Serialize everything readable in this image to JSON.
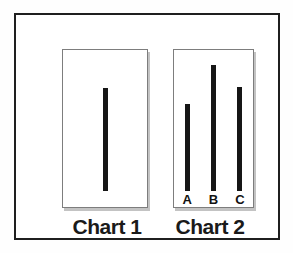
{
  "panels": [
    {
      "title": "Chart 1",
      "bars": [
        {
          "label": "",
          "value": 103
        }
      ]
    },
    {
      "title": "Chart 2",
      "bars": [
        {
          "label": "A",
          "value": 87
        },
        {
          "label": "B",
          "value": 126
        },
        {
          "label": "C",
          "value": 104
        }
      ]
    }
  ],
  "chart_data": [
    {
      "type": "bar",
      "title": "Chart 1",
      "categories": [
        ""
      ],
      "values": [
        103
      ],
      "xlabel": "",
      "ylabel": "",
      "ylim": [
        0,
        159
      ],
      "grid": false,
      "legend": false,
      "notes": "Single thin vertical black line centered in a bordered white panel; no axes, ticks, or numeric labels. Values are relative line lengths in screen pixels."
    },
    {
      "type": "bar",
      "title": "Chart 2",
      "categories": [
        "A",
        "B",
        "C"
      ],
      "values": [
        87,
        126,
        104
      ],
      "xlabel": "",
      "ylabel": "",
      "ylim": [
        0,
        159
      ],
      "grid": false,
      "legend": false,
      "notes": "Three thin vertical black lines bottom-aligned, labeled A, B, C beneath; middle line B is tallest. No axes or numeric labels. Values are relative line lengths in screen pixels."
    }
  ],
  "colors": {
    "background": "#ffffff",
    "frame_border": "#1f1f1f",
    "panel_border": "#7d7d7d",
    "panel_shadow": "#c3c3c3",
    "bar": "#161616",
    "text": "#1a1a1a"
  }
}
